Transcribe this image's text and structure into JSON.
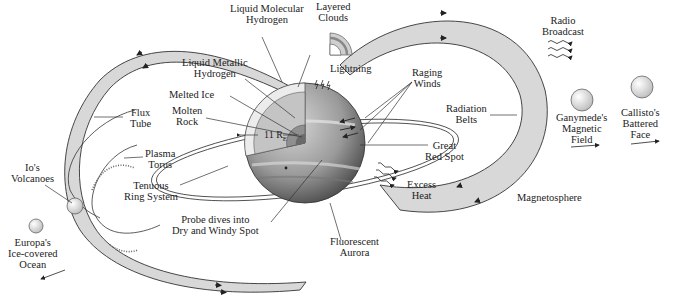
{
  "figure": {
    "colors": {
      "band_fill": "#d8d8d8",
      "outline": "#333333",
      "planet_dark": "#555555",
      "planet_light": "#c8c8c8",
      "interior_light": "#e8e8e8",
      "interior_mid": "#bdbdbd",
      "interior_core": "#8a8a8a",
      "moon_fill": "#e0e0e0",
      "background": "#ffffff"
    },
    "labels": {
      "liquid_molecular_hydrogen": [
        "Liquid Molecular",
        "Hydrogen"
      ],
      "layered_clouds": [
        "Layered",
        "Clouds"
      ],
      "liquid_metallic_hydrogen": [
        "Liquid Metallic",
        "Hydrogen"
      ],
      "lightning": [
        "Lightning"
      ],
      "melted_ice": [
        "Melted Ice"
      ],
      "molten_rock": [
        "Molten",
        "Rock"
      ],
      "flux_tube": [
        "Flux",
        "Tube"
      ],
      "raging_winds": [
        "Raging",
        "Winds"
      ],
      "radiation_belts": [
        "Radiation",
        "Belts"
      ],
      "radio_broadcast": [
        "Radio",
        "Broadcast"
      ],
      "ganymede": [
        "Ganymede's",
        "Magnetic",
        "Field"
      ],
      "callisto": [
        "Callisto's",
        "Battered",
        "Face"
      ],
      "radius": "11 R",
      "radius_sub": "E",
      "plasma_torus": [
        "Plasma",
        "Torus"
      ],
      "io_volcanoes": [
        "Io's",
        "Volcanoes"
      ],
      "great_red_spot": [
        "Great",
        "Red Spot"
      ],
      "tenuous_ring": [
        "Tenuous",
        "Ring System"
      ],
      "excess_heat": [
        "Excess",
        "Heat"
      ],
      "magnetosphere": [
        "Magnetosphere"
      ],
      "probe": [
        "Probe dives into",
        "Dry and Windy Spot"
      ],
      "europa": [
        "Europa's",
        "Ice-covered",
        "Ocean"
      ],
      "fluorescent_aurora": [
        "Fluorescent",
        "Aurora"
      ]
    }
  }
}
